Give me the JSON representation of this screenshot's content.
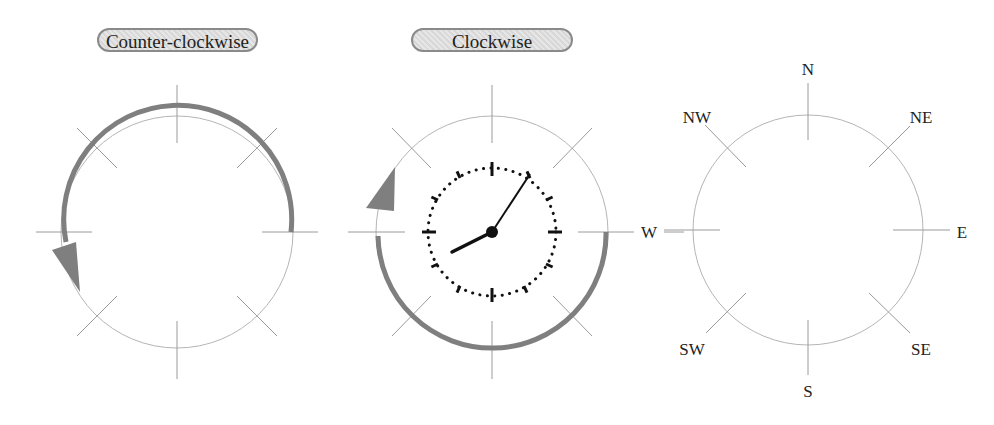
{
  "buttons": {
    "counter_clockwise": "Counter-clockwise",
    "clockwise": "Clockwise"
  },
  "compass": {
    "labels": {
      "N": "N",
      "NE": "NE",
      "E": "E",
      "SE": "SE",
      "S": "S",
      "SW": "SW",
      "W": "W",
      "NW": "NW"
    }
  },
  "clock": {
    "hour_hand_time": "8",
    "minute_hand_time": "5"
  },
  "colors": {
    "arrow": "#7f7f7f",
    "circle": "#b0b0b0",
    "tick": "#9a9a9a",
    "clock": "#111111"
  }
}
